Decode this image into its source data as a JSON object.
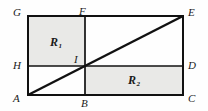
{
  "figure": {
    "type": "geometry-diagram",
    "canvas": {
      "width": 208,
      "height": 111
    },
    "colors": {
      "background": "#fefefe",
      "stroke": "#111111",
      "shade_fill": "#e9e9e7"
    },
    "vertices": [
      {
        "id": "G",
        "label": "G",
        "x": 28,
        "y": 16,
        "label_x": 13,
        "label_y": 7
      },
      {
        "id": "F",
        "label": "F",
        "x": 85,
        "y": 16,
        "label_x": 79,
        "label_y": 6
      },
      {
        "id": "E",
        "label": "E",
        "x": 183,
        "y": 16,
        "label_x": 188,
        "label_y": 7
      },
      {
        "id": "H",
        "label": "H",
        "x": 28,
        "y": 66,
        "label_x": 13,
        "label_y": 60
      },
      {
        "id": "I",
        "label": "I",
        "x": 85,
        "y": 66,
        "label_x": 73,
        "label_y": 54
      },
      {
        "id": "D",
        "label": "D",
        "x": 183,
        "y": 66,
        "label_x": 188,
        "label_y": 60
      },
      {
        "id": "A",
        "label": "A",
        "x": 28,
        "y": 95,
        "label_x": 13,
        "label_y": 93
      },
      {
        "id": "B",
        "label": "B",
        "x": 85,
        "y": 95,
        "label_x": 81,
        "label_y": 98
      },
      {
        "id": "C",
        "label": "C",
        "x": 183,
        "y": 95,
        "label_x": 188,
        "label_y": 93
      }
    ],
    "segments": [
      {
        "id": "outer-rectangle",
        "from": "A",
        "to": "C",
        "note": "rectangle A-C-E-G outer boundary",
        "width": 2
      },
      {
        "id": "vertical-FB",
        "from": "F",
        "to": "B",
        "width": 1.6
      },
      {
        "id": "horizontal-HD",
        "from": "H",
        "to": "D",
        "width": 1.6
      },
      {
        "id": "diagonal-AE",
        "from": "A",
        "to": "E",
        "width": 2.4
      }
    ],
    "shaded_regions": [
      {
        "id": "R1",
        "label": "R",
        "subscript": "1",
        "corners": [
          "G",
          "F",
          "I",
          "H"
        ],
        "x": 28,
        "y": 16,
        "width": 57,
        "height": 50,
        "label_x": 50,
        "label_y": 36
      },
      {
        "id": "R2",
        "label": "R",
        "subscript": "2",
        "corners": [
          "I",
          "D",
          "C",
          "B"
        ],
        "x": 85,
        "y": 66,
        "width": 98,
        "height": 29,
        "label_x": 128,
        "label_y": 74
      }
    ]
  }
}
